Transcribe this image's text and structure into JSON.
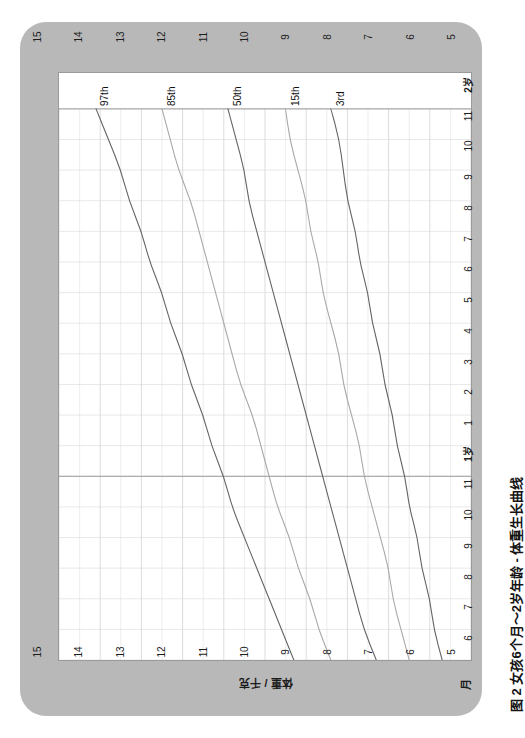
{
  "caption": "图 2  女孩6个月～2岁年龄 - 体重生长曲线",
  "axes": {
    "weight_title": "体重 / 千克",
    "month_title": "月",
    "weight_ticks_top": [
      "15",
      "14",
      "13",
      "12",
      "11",
      "10",
      "9",
      "8",
      "7",
      "6",
      "5"
    ],
    "weight_ticks_bottom": [
      "15",
      "14",
      "13",
      "12",
      "11",
      "10",
      "9",
      "8",
      "7",
      "6",
      "5"
    ],
    "month_ticks": [
      "月",
      "6",
      "7",
      "8",
      "9",
      "10",
      "11",
      "1岁",
      "1",
      "2",
      "3",
      "4",
      "5",
      "6",
      "7",
      "8",
      "9",
      "10",
      "11",
      "2岁"
    ]
  },
  "curve_labels": [
    "97th",
    "85th",
    "50th",
    "15th",
    "3rd"
  ],
  "colors": {
    "card": "#b8b8b8",
    "plot_background": "#ffffff",
    "grid_minor": "#d8d8d8",
    "grid_major": "#9a9a9a",
    "curve_dark": "#646464",
    "curve_light": "#a8a8a8",
    "text": "#1d1d1d"
  },
  "chart_data": {
    "type": "line",
    "title": "图 2  女孩6个月～2岁年龄 - 体重生长曲线",
    "xlabel": "月",
    "ylabel": "体重 / 千克",
    "orientation": "rotated-90",
    "x": [
      6,
      7,
      8,
      9,
      10,
      11,
      12,
      13,
      14,
      15,
      16,
      17,
      18,
      19,
      20,
      21,
      22,
      23,
      24
    ],
    "x_tick_labels": [
      "6",
      "7",
      "8",
      "9",
      "10",
      "11",
      "1岁",
      "1",
      "2",
      "3",
      "4",
      "5",
      "6",
      "7",
      "8",
      "9",
      "10",
      "11",
      "2岁"
    ],
    "xlim": [
      6,
      24
    ],
    "ylim": [
      5,
      15
    ],
    "ytick_labels": [
      "5",
      "6",
      "7",
      "8",
      "9",
      "10",
      "11",
      "12",
      "13",
      "14",
      "15"
    ],
    "grid": true,
    "legend": "inline-curve-labels",
    "series": [
      {
        "name": "97th",
        "color": "#646464",
        "values": [
          9.3,
          9.6,
          9.9,
          10.2,
          10.5,
          10.8,
          11.0,
          11.3,
          11.5,
          11.8,
          12.0,
          12.3,
          12.5,
          12.8,
          13.0,
          13.3,
          13.5,
          13.8,
          14.1
        ]
      },
      {
        "name": "85th",
        "color": "#a8a8a8",
        "values": [
          8.4,
          8.7,
          8.9,
          9.2,
          9.4,
          9.7,
          9.9,
          10.1,
          10.3,
          10.6,
          10.8,
          11.0,
          11.2,
          11.4,
          11.6,
          11.8,
          12.1,
          12.3,
          12.5
        ]
      },
      {
        "name": "50th",
        "color": "#646464",
        "values": [
          7.3,
          7.6,
          7.8,
          8.0,
          8.2,
          8.4,
          8.6,
          8.8,
          9.0,
          9.2,
          9.4,
          9.6,
          9.8,
          10.0,
          10.2,
          10.4,
          10.5,
          10.7,
          10.9
        ]
      },
      {
        "name": "15th",
        "color": "#a8a8a8",
        "values": [
          6.5,
          6.7,
          6.9,
          7.0,
          7.2,
          7.4,
          7.6,
          7.7,
          7.9,
          8.1,
          8.2,
          8.4,
          8.6,
          8.7,
          8.9,
          9.0,
          9.2,
          9.4,
          9.5
        ]
      },
      {
        "name": "3rd",
        "color": "#646464",
        "values": [
          5.7,
          5.9,
          6.0,
          6.2,
          6.3,
          6.5,
          6.6,
          6.8,
          6.9,
          7.1,
          7.2,
          7.4,
          7.5,
          7.7,
          7.8,
          8.0,
          8.1,
          8.2,
          8.4
        ]
      }
    ]
  }
}
